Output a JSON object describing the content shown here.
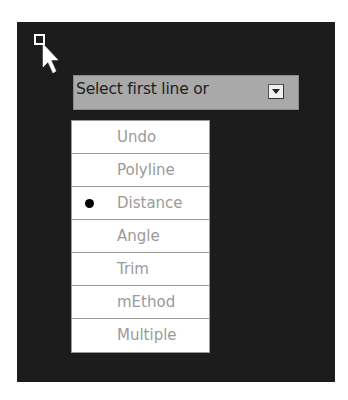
{
  "prompt": {
    "text": "Select first line or",
    "dropdown_icon": "dropdown-arrow-icon"
  },
  "cursor": {
    "icon": "pickbox-arrow-cursor-icon"
  },
  "menu": {
    "items": [
      {
        "label": "Undo",
        "selected": false
      },
      {
        "label": "Polyline",
        "selected": false
      },
      {
        "label": "Distance",
        "selected": true
      },
      {
        "label": "Angle",
        "selected": false
      },
      {
        "label": "Trim",
        "selected": false
      },
      {
        "label": "mEthod",
        "selected": false
      },
      {
        "label": "Multiple",
        "selected": false
      }
    ]
  },
  "colors": {
    "background": "#1c1c1c",
    "prompt_bg": "#a9a9a9",
    "menu_text": "#9a9a9a"
  }
}
